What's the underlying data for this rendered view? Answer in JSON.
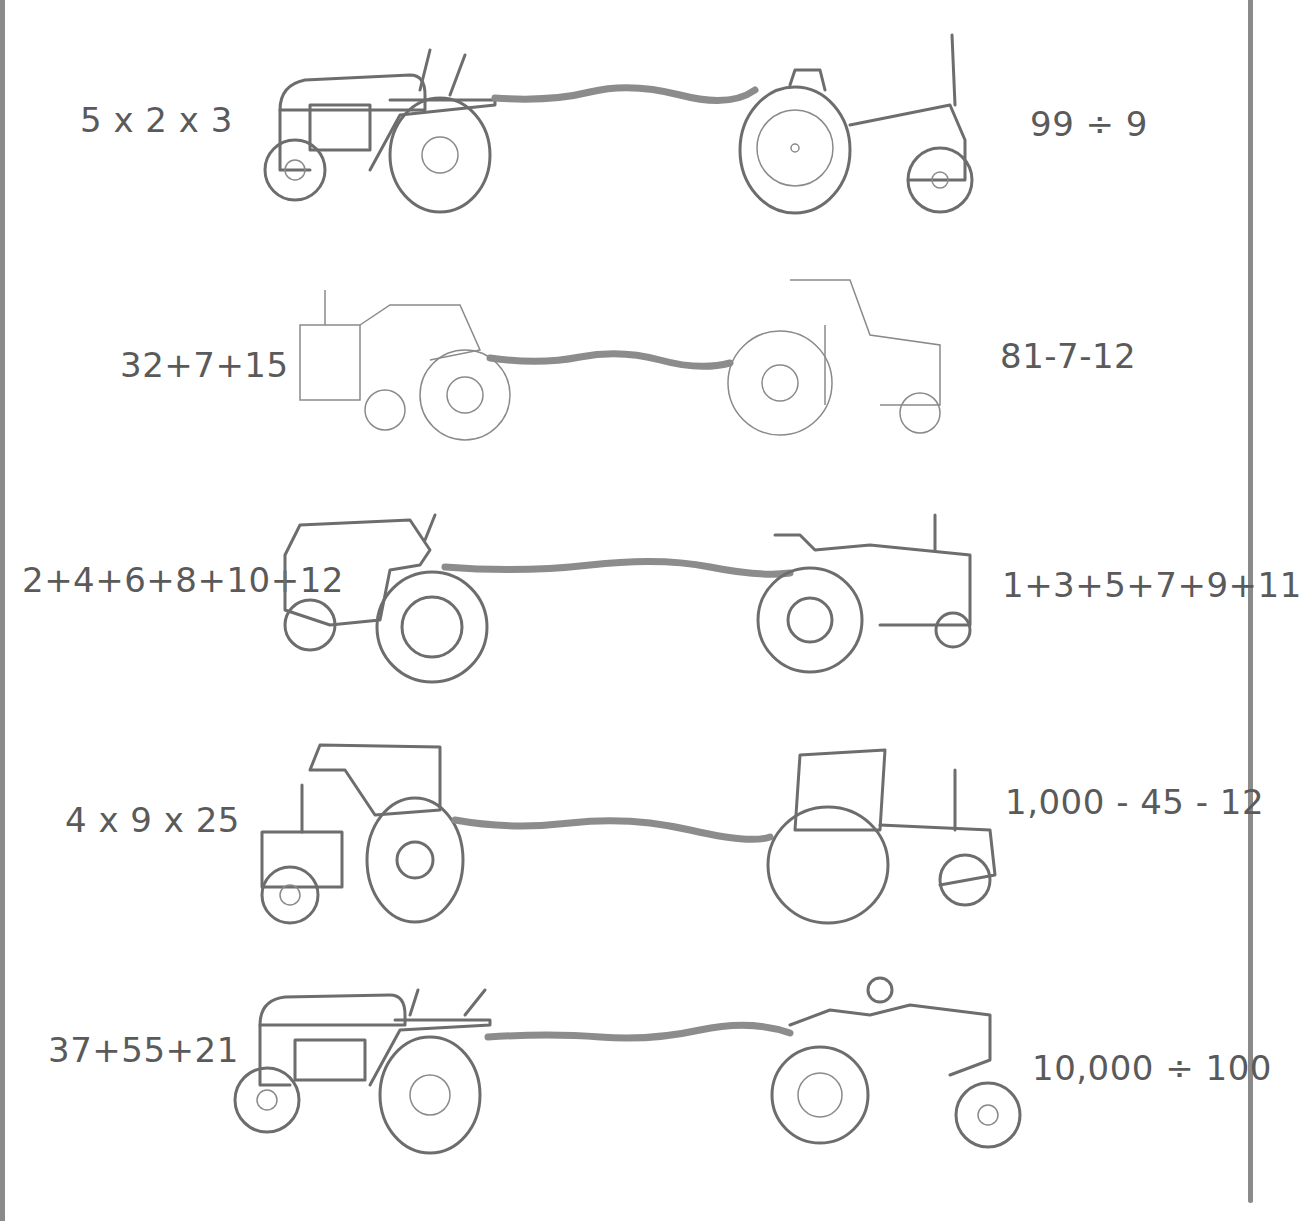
{
  "worksheet": {
    "rows": [
      {
        "left_expression": "5 x 2 x 3",
        "right_expression": "99 ÷ 9",
        "left_icon": "tractor-icon",
        "right_icon": "tractor-icon"
      },
      {
        "left_expression": "32+7+15",
        "right_expression": "81-7-12",
        "left_icon": "tractor-icon",
        "right_icon": "tractor-icon"
      },
      {
        "left_expression": "2+4+6+8+10+12",
        "right_expression": "1+3+5+7+9+11",
        "left_icon": "tractor-icon",
        "right_icon": "tractor-icon"
      },
      {
        "left_expression": "4 x 9 x 25",
        "right_expression": "1,000 - 45 - 12",
        "left_icon": "tractor-icon",
        "right_icon": "tractor-icon"
      },
      {
        "left_expression": "37+55+21",
        "right_expression": "10,000 ÷ 100",
        "left_icon": "tractor-icon",
        "right_icon": "tractor-icon"
      }
    ],
    "colors": {
      "line": "#6d6d6d",
      "rope": "#8c8c8c",
      "text": "#5a5a5a",
      "frame": "#8a8a8a"
    }
  }
}
